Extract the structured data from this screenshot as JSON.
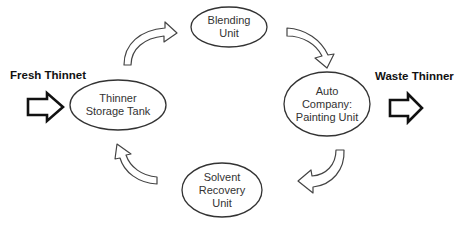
{
  "diagram": {
    "type": "cycle",
    "colors": {
      "stroke": "#333333",
      "fill": "#ffffff",
      "text": "#333333"
    },
    "nodes": [
      {
        "id": "blending",
        "line1": "Blending",
        "line2": "Unit",
        "line3": ""
      },
      {
        "id": "painting",
        "line1": "Auto",
        "line2": "Company:",
        "line3": "Painting Unit"
      },
      {
        "id": "recovery",
        "line1": "Solvent",
        "line2": "Recovery",
        "line3": "Unit"
      },
      {
        "id": "storage",
        "line1": "Thinner",
        "line2": "Storage Tank",
        "line3": ""
      }
    ],
    "inputs": {
      "fresh_label": "Fresh Thinnet"
    },
    "outputs": {
      "waste_label": "Waste Thinner"
    },
    "flow": [
      "storage -> blending",
      "blending -> painting",
      "painting -> recovery",
      "recovery -> storage"
    ]
  }
}
